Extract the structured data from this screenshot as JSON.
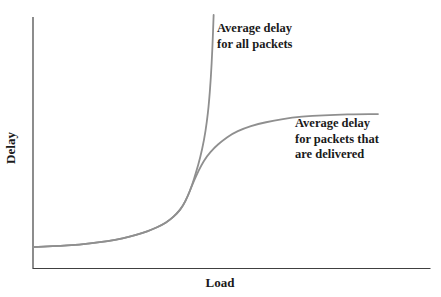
{
  "figure": {
    "background_color": "#ffffff",
    "text_color": "#1a1a1a"
  },
  "axes": {
    "x_label": "Load",
    "y_label": "Delay",
    "color": "#404040",
    "ticks": "none (unlabeled conceptual axes)"
  },
  "annotations": {
    "all_packets_label": "Average delay\nfor all packets",
    "delivered_label": "Average delay\nfor packets that\nare delivered"
  },
  "chart_data": {
    "type": "line",
    "title": "",
    "xlabel": "Load",
    "ylabel": "Delay",
    "xlim": [
      0,
      1
    ],
    "ylim": [
      0,
      1
    ],
    "grid": false,
    "legend_position": "inline annotations next to curves",
    "axis_note": "qualitative diagram - no numeric tick labels; values normalized 0-1 from pixel positions",
    "curve_color": "#8f8f8f",
    "series": [
      {
        "name": "Average delay for all packets",
        "color": "#8f8f8f",
        "behavior": "rises slowly then diverges to infinity near load ~0.45",
        "points": [
          [
            0.0,
            0.085
          ],
          [
            0.055,
            0.089
          ],
          [
            0.118,
            0.095
          ],
          [
            0.169,
            0.105
          ],
          [
            0.207,
            0.113
          ],
          [
            0.244,
            0.127
          ],
          [
            0.275,
            0.141
          ],
          [
            0.3,
            0.155
          ],
          [
            0.325,
            0.173
          ],
          [
            0.345,
            0.193
          ],
          [
            0.363,
            0.219
          ],
          [
            0.378,
            0.249
          ],
          [
            0.39,
            0.288
          ],
          [
            0.4,
            0.328
          ],
          [
            0.411,
            0.384
          ],
          [
            0.421,
            0.439
          ],
          [
            0.431,
            0.511
          ],
          [
            0.438,
            0.583
          ],
          [
            0.443,
            0.654
          ],
          [
            0.448,
            0.757
          ],
          [
            0.452,
            0.877
          ],
          [
            0.455,
            1.008
          ]
        ]
      },
      {
        "name": "Average delay for packets that are delivered",
        "color": "#8f8f8f",
        "behavior": "follows first curve then saturates to a plateau at delay ~0.61",
        "points": [
          [
            0.0,
            0.085
          ],
          [
            0.055,
            0.089
          ],
          [
            0.118,
            0.095
          ],
          [
            0.169,
            0.105
          ],
          [
            0.207,
            0.113
          ],
          [
            0.244,
            0.127
          ],
          [
            0.275,
            0.141
          ],
          [
            0.3,
            0.155
          ],
          [
            0.325,
            0.173
          ],
          [
            0.345,
            0.193
          ],
          [
            0.363,
            0.219
          ],
          [
            0.378,
            0.249
          ],
          [
            0.39,
            0.288
          ],
          [
            0.4,
            0.328
          ],
          [
            0.411,
            0.368
          ],
          [
            0.423,
            0.408
          ],
          [
            0.438,
            0.447
          ],
          [
            0.456,
            0.479
          ],
          [
            0.476,
            0.507
          ],
          [
            0.501,
            0.535
          ],
          [
            0.531,
            0.557
          ],
          [
            0.567,
            0.575
          ],
          [
            0.607,
            0.588
          ],
          [
            0.652,
            0.6
          ],
          [
            0.703,
            0.607
          ],
          [
            0.761,
            0.611
          ],
          [
            0.824,
            0.614
          ],
          [
            0.869,
            0.614
          ]
        ]
      }
    ]
  }
}
